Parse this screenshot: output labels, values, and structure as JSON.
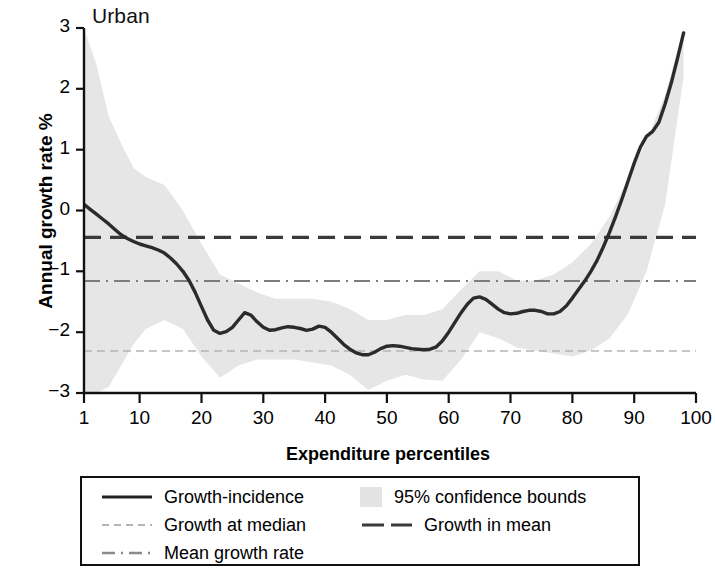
{
  "chart_data": {
    "type": "line",
    "title": "Urban",
    "xlabel": "Expenditure percentiles",
    "ylabel": "Annual growth rate %",
    "xlim": [
      1,
      100
    ],
    "ylim": [
      -3,
      3
    ],
    "grid": false,
    "legend_position": "below",
    "xticks": [
      1,
      10,
      20,
      30,
      40,
      50,
      60,
      70,
      80,
      90,
      100
    ],
    "xtick_labels": [
      "1",
      "10",
      "20",
      "30",
      "40",
      "50",
      "60",
      "70",
      "80",
      "90",
      "100"
    ],
    "yticks": [
      -3,
      -2,
      -1,
      0,
      1,
      2,
      3
    ],
    "ytick_labels": [
      "−3",
      "−2",
      "−1",
      "0",
      "1",
      "2",
      "3"
    ],
    "series": [
      {
        "name": "Growth-incidence",
        "style": "solid",
        "color": "#2b2b2b",
        "x": [
          1,
          2,
          3,
          4,
          5,
          6,
          7,
          8,
          9,
          10,
          11,
          12,
          13,
          14,
          15,
          16,
          17,
          18,
          19,
          20,
          21,
          22,
          23,
          24,
          25,
          26,
          27,
          28,
          29,
          30,
          31,
          32,
          33,
          34,
          35,
          36,
          37,
          38,
          39,
          40,
          41,
          42,
          43,
          44,
          45,
          46,
          47,
          48,
          49,
          50,
          51,
          52,
          53,
          54,
          55,
          56,
          57,
          58,
          59,
          60,
          61,
          62,
          63,
          64,
          65,
          66,
          67,
          68,
          69,
          70,
          71,
          72,
          73,
          74,
          75,
          76,
          77,
          78,
          79,
          80,
          81,
          82,
          83,
          84,
          85,
          86,
          87,
          88,
          89,
          90,
          91,
          92,
          93,
          94,
          95,
          96,
          97,
          98
        ],
        "values": [
          0.1,
          0.02,
          -0.06,
          -0.14,
          -0.22,
          -0.31,
          -0.4,
          -0.46,
          -0.51,
          -0.55,
          -0.58,
          -0.61,
          -0.65,
          -0.7,
          -0.78,
          -0.88,
          -1.0,
          -1.15,
          -1.35,
          -1.58,
          -1.8,
          -1.97,
          -2.02,
          -1.99,
          -1.92,
          -1.8,
          -1.68,
          -1.72,
          -1.83,
          -1.92,
          -1.97,
          -1.96,
          -1.93,
          -1.91,
          -1.92,
          -1.94,
          -1.97,
          -1.95,
          -1.9,
          -1.92,
          -2.0,
          -2.1,
          -2.2,
          -2.28,
          -2.34,
          -2.37,
          -2.37,
          -2.33,
          -2.27,
          -2.23,
          -2.22,
          -2.23,
          -2.25,
          -2.27,
          -2.28,
          -2.29,
          -2.28,
          -2.24,
          -2.14,
          -2.0,
          -1.84,
          -1.68,
          -1.54,
          -1.44,
          -1.42,
          -1.46,
          -1.54,
          -1.62,
          -1.68,
          -1.7,
          -1.69,
          -1.66,
          -1.64,
          -1.64,
          -1.66,
          -1.7,
          -1.7,
          -1.66,
          -1.57,
          -1.44,
          -1.3,
          -1.16,
          -1.0,
          -0.82,
          -0.6,
          -0.36,
          -0.1,
          0.18,
          0.48,
          0.78,
          1.04,
          1.22,
          1.3,
          1.45,
          1.75,
          2.1,
          2.5,
          2.92
        ]
      }
    ],
    "reference_lines": [
      {
        "name": "Growth in mean",
        "value": -0.44,
        "style": "dashed",
        "color": "#3a3a3a"
      },
      {
        "name": "Mean growth rate",
        "value": -1.16,
        "style": "dashdot",
        "color": "#7d7d7d"
      },
      {
        "name": "Growth at median",
        "value": -2.31,
        "style": "dotted",
        "color": "#b4b4b4"
      }
    ],
    "confidence_band": {
      "name": "95% confidence bounds",
      "level": "95%",
      "color": "#e6e6e6",
      "x": [
        1,
        3,
        5,
        7,
        9,
        11,
        14,
        17,
        20,
        23,
        26,
        29,
        32,
        35,
        38,
        41,
        44,
        47,
        50,
        53,
        56,
        59,
        62,
        65,
        68,
        71,
        74,
        77,
        80,
        83,
        86,
        89,
        92,
        95,
        98
      ],
      "upper": [
        3.3,
        2.4,
        1.55,
        1.1,
        0.7,
        0.55,
        0.42,
        0.0,
        -0.55,
        -1.05,
        -1.2,
        -1.35,
        -1.45,
        -1.45,
        -1.45,
        -1.5,
        -1.62,
        -1.8,
        -1.8,
        -1.72,
        -1.72,
        -1.62,
        -1.3,
        -1.0,
        -1.0,
        -1.15,
        -1.15,
        -1.05,
        -0.85,
        -0.55,
        -0.1,
        0.52,
        1.15,
        1.9,
        3.05
      ],
      "lower": [
        -3.3,
        -3.1,
        -2.9,
        -2.55,
        -2.2,
        -1.95,
        -1.8,
        -1.95,
        -2.4,
        -2.75,
        -2.55,
        -2.45,
        -2.45,
        -2.45,
        -2.5,
        -2.55,
        -2.7,
        -2.95,
        -2.8,
        -2.7,
        -2.78,
        -2.8,
        -2.45,
        -2.0,
        -2.1,
        -2.25,
        -2.3,
        -2.35,
        -2.4,
        -2.3,
        -2.1,
        -1.7,
        -1.0,
        0.1,
        2.2
      ]
    }
  },
  "legend": {
    "items": [
      {
        "label": "Growth-incidence",
        "sample": "solid-line",
        "position": "col1-row1"
      },
      {
        "label": "95% confidence bounds",
        "sample": "shaded-band",
        "position": "col2-row1"
      },
      {
        "label": "Growth at median",
        "sample": "dotted-line",
        "position": "col1-row2"
      },
      {
        "label": "Growth in mean",
        "sample": "dashed-line",
        "position": "col2-row2"
      },
      {
        "label": "Mean growth rate",
        "sample": "dashdot-line",
        "position": "col1-row3"
      }
    ]
  }
}
